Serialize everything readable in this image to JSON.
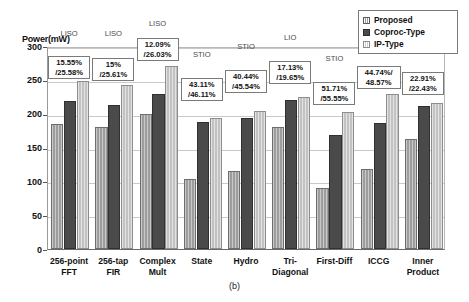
{
  "figure": {
    "caption": "(b)",
    "ylabel": "Power(mW)"
  },
  "legend": {
    "position": "top-right",
    "items": [
      {
        "label": "Proposed",
        "key": "proposed",
        "color": "#9d9d9d"
      },
      {
        "label": "Coproc-Type",
        "key": "coproc",
        "color": "#4a4a4a"
      },
      {
        "label": "IP-Type",
        "key": "ip",
        "color": "#c2c2c2"
      }
    ]
  },
  "axis": {
    "yticks": [
      0,
      50,
      100,
      150,
      200,
      250,
      300
    ],
    "ymin": 0,
    "ymax": 300
  },
  "chart_data": {
    "type": "bar",
    "title": "",
    "xlabel": "",
    "ylabel": "Power(mW)",
    "ylim": [
      0,
      300
    ],
    "ytick_values": [
      0,
      50,
      100,
      150,
      200,
      250,
      300
    ],
    "grid": true,
    "legend_position": "top-right",
    "categories": [
      "256-point\nFFT",
      "256-tap\nFIR",
      "Complex\nMult",
      "State",
      "Hydro",
      "Tri-\nDiagonal",
      "First-Diff",
      "ICCG",
      "Inner\nProduct"
    ],
    "series": [
      {
        "name": "Proposed",
        "values": [
          185,
          181,
          200,
          104,
          115,
          180,
          90,
          118,
          163
        ]
      },
      {
        "name": "Coproc-Type",
        "values": [
          219,
          213,
          229,
          187,
          194,
          220,
          169,
          186,
          212
        ]
      },
      {
        "name": "IP-Type",
        "values": [
          248,
          243,
          270,
          194,
          204,
          224,
          202,
          229,
          216
        ]
      }
    ],
    "annotations": [
      {
        "category": "256-point FFT",
        "io_type": "LISO",
        "label": "15.55%\n/25.58%"
      },
      {
        "category": "256-tap FIR",
        "io_type": "LISO",
        "label": "15%\n/25.61%"
      },
      {
        "category": "Complex Mult",
        "io_type": "LISO",
        "label": "12.09%\n/26.03%"
      },
      {
        "category": "State",
        "io_type": "STIO",
        "label": "43.11%\n/46.11%"
      },
      {
        "category": "Hydro",
        "io_type": "STIO",
        "label": "40.44%\n/45.54%"
      },
      {
        "category": "Tri-Diagonal",
        "io_type": "LIO",
        "label": "17.13%\n/19.65%"
      },
      {
        "category": "First-Diff",
        "io_type": "STIO",
        "label": "51.71%\n/55.55%"
      },
      {
        "category": "ICCG",
        "io_type": "STIO",
        "label": "44.74%/\n48.57%"
      },
      {
        "category": "Inner Product",
        "io_type": "LIO",
        "label": "22.91%\n/22.43%"
      }
    ]
  }
}
